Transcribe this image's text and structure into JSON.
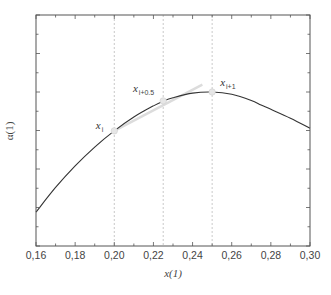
{
  "chart_data": {
    "type": "line",
    "title": "",
    "xlabel": "x(1)",
    "ylabel": "α(1)",
    "xlim": [
      0.16,
      0.3
    ],
    "ylim": [
      0,
      6
    ],
    "x_ticks": [
      "0.16",
      "0.18",
      "0.20",
      "0.22",
      "0.24",
      "0.26",
      "0.28",
      "0.30"
    ],
    "y_ticks_labeled": false,
    "grid": false,
    "series": [
      {
        "name": "α(x) curve",
        "color": "#333333",
        "x": [
          0.16,
          0.17,
          0.18,
          0.19,
          0.2,
          0.21,
          0.22,
          0.225,
          0.23,
          0.24,
          0.25,
          0.26,
          0.27,
          0.275,
          0.28,
          0.29,
          0.3
        ],
        "values": [
          0.88,
          1.52,
          2.08,
          2.57,
          2.99,
          3.35,
          3.64,
          3.76,
          3.85,
          3.97,
          4.0,
          3.94,
          3.78,
          3.66,
          3.55,
          3.32,
          3.06
        ]
      },
      {
        "name": "linear segment",
        "color": "#dcdcdc",
        "x": [
          0.2,
          0.245
        ],
        "values": [
          2.99,
          4.19
        ]
      }
    ],
    "vertical_reference_lines": [
      0.2,
      0.225,
      0.25
    ],
    "annotated_points": [
      {
        "label": "x",
        "subscript": "i",
        "x": 0.2,
        "value": 2.99
      },
      {
        "label": "x",
        "subscript": "i+0.5",
        "x": 0.225,
        "value": 3.77
      },
      {
        "label": "x",
        "subscript": "i+1",
        "x": 0.25,
        "value": 4.0
      }
    ]
  }
}
